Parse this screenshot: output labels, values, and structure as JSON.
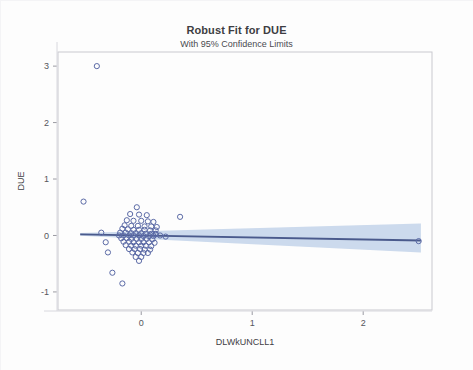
{
  "chart_data": {
    "type": "scatter",
    "title": "Robust Fit for DUE",
    "subtitle": "With 95% Confidence Limits",
    "xlabel": "DLWkUNCLL1",
    "ylabel": "DUE",
    "xlim": [
      -0.75,
      2.62
    ],
    "ylim": [
      -1.32,
      3.25
    ],
    "xticks": [
      0,
      1,
      2
    ],
    "xtick_labels": [
      "0",
      "1",
      "2"
    ],
    "yticks": [
      -1,
      0,
      1,
      2,
      3
    ],
    "ytick_labels": [
      "-1",
      "0",
      "1",
      "2",
      "3"
    ],
    "grid": false,
    "legend": null,
    "marker": "open-circle",
    "marker_color": "#5b6aa6",
    "fit_line_color": "#4a5a8c",
    "confidence_band_color": "#b8cce6",
    "fit_line": {
      "x": [
        -0.55,
        2.52
      ],
      "y": [
        0.02,
        -0.09
      ],
      "intercept": 0.0,
      "slope": -0.036
    },
    "confidence_band": {
      "x": [
        -0.55,
        2.52
      ],
      "upper": [
        0.045,
        0.21
      ],
      "lower": [
        -0.005,
        -0.3
      ]
    },
    "points": [
      [
        -0.4,
        3.0
      ],
      [
        -0.52,
        0.6
      ],
      [
        0.35,
        0.33
      ],
      [
        -0.36,
        0.05
      ],
      [
        -0.32,
        -0.12
      ],
      [
        -0.3,
        -0.3
      ],
      [
        -0.26,
        -0.66
      ],
      [
        -0.17,
        -0.85
      ],
      [
        2.5,
        -0.1
      ],
      [
        0.22,
        -0.02
      ],
      [
        0.17,
        0.0
      ],
      [
        0.13,
        0.02
      ],
      [
        -0.04,
        0.5
      ],
      [
        -0.1,
        0.38
      ],
      [
        -0.02,
        0.37
      ],
      [
        0.05,
        0.36
      ],
      [
        -0.13,
        0.27
      ],
      [
        -0.07,
        0.26
      ],
      [
        0.0,
        0.26
      ],
      [
        0.06,
        0.25
      ],
      [
        0.11,
        0.24
      ],
      [
        -0.15,
        0.18
      ],
      [
        -0.09,
        0.17
      ],
      [
        -0.03,
        0.17
      ],
      [
        0.03,
        0.16
      ],
      [
        0.09,
        0.16
      ],
      [
        0.14,
        0.15
      ],
      [
        -0.17,
        0.12
      ],
      [
        -0.12,
        0.11
      ],
      [
        -0.07,
        0.1
      ],
      [
        -0.02,
        0.1
      ],
      [
        0.03,
        0.1
      ],
      [
        0.08,
        0.09
      ],
      [
        0.13,
        0.09
      ],
      [
        -0.19,
        0.05
      ],
      [
        -0.14,
        0.05
      ],
      [
        -0.09,
        0.04
      ],
      [
        -0.05,
        0.04
      ],
      [
        0.0,
        0.04
      ],
      [
        0.04,
        0.03
      ],
      [
        0.09,
        0.03
      ],
      [
        0.13,
        0.03
      ],
      [
        -0.2,
        0.0
      ],
      [
        -0.16,
        0.0
      ],
      [
        -0.11,
        0.0
      ],
      [
        -0.07,
        0.0
      ],
      [
        -0.02,
        0.0
      ],
      [
        0.02,
        -0.01
      ],
      [
        0.07,
        -0.01
      ],
      [
        0.11,
        -0.01
      ],
      [
        -0.18,
        -0.05
      ],
      [
        -0.13,
        -0.05
      ],
      [
        -0.09,
        -0.06
      ],
      [
        -0.04,
        -0.06
      ],
      [
        0.0,
        -0.06
      ],
      [
        0.05,
        -0.06
      ],
      [
        0.1,
        -0.07
      ],
      [
        -0.16,
        -0.11
      ],
      [
        -0.11,
        -0.11
      ],
      [
        -0.07,
        -0.12
      ],
      [
        -0.02,
        -0.12
      ],
      [
        0.02,
        -0.12
      ],
      [
        0.07,
        -0.12
      ],
      [
        0.12,
        -0.13
      ],
      [
        -0.14,
        -0.17
      ],
      [
        -0.09,
        -0.18
      ],
      [
        -0.05,
        -0.18
      ],
      [
        0.0,
        -0.18
      ],
      [
        0.04,
        -0.18
      ],
      [
        0.09,
        -0.19
      ],
      [
        -0.11,
        -0.24
      ],
      [
        -0.06,
        -0.24
      ],
      [
        -0.01,
        -0.24
      ],
      [
        0.03,
        -0.25
      ],
      [
        0.08,
        -0.25
      ],
      [
        -0.08,
        -0.3
      ],
      [
        -0.03,
        -0.31
      ],
      [
        0.02,
        -0.31
      ],
      [
        0.06,
        -0.31
      ],
      [
        -0.05,
        -0.38
      ],
      [
        0.0,
        -0.38
      ],
      [
        -0.02,
        -0.45
      ]
    ]
  }
}
